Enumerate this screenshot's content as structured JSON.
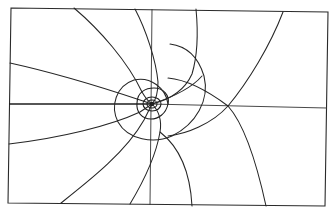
{
  "figure": {
    "kind": "field-line diagram",
    "stroke_color": "#262626",
    "background": "#ffffff",
    "frame": {
      "points": "11,8 328,12 325,206 8,203"
    },
    "axes": {
      "horizontal_left": "M 9,104 L 150,104",
      "horizontal_right": "M 150,104 L 327,108",
      "vertical": "M 152,9 L 150,205"
    },
    "center": {
      "cx": 152,
      "cy": 104
    },
    "rings": [
      {
        "name": "ring-inner",
        "d": "M 147,104 a 5,4 0 1,0 10,0 a 5,4 0 1,0 -10,0"
      },
      {
        "name": "ring-small",
        "d": "M 143,104 a 9,7 0 1,0 18,0 a 9,7 0 1,0 -18,0"
      },
      {
        "name": "ring-mid",
        "d": "M 137,103 C 137,92 146,88 154,88 C 163,88 170,95 168,104 C 166,114 158,119 151,119 C 142,119 136,112 137,103 Z"
      }
    ],
    "curves": [
      {
        "name": "spiral-large",
        "d": "M 168,104 C 166,88 150,76 134,80 C 116,86 110,106 118,122 C 128,140 154,144 172,136 C 196,124 210,100 204,76 C 198,56 186,46 170,44"
      },
      {
        "name": "line-top-left-1",
        "d": "M 74,8 C 100,30 128,62 142,92 C 146,99 149,102 152,104"
      },
      {
        "name": "line-top-left-2",
        "d": "M 135,9 C 146,30 156,60 158,82 C 158,92 156,100 152,104"
      },
      {
        "name": "line-left-upper",
        "d": "M 10,63 C 60,74 110,90 140,100 C 146,102 149,103 152,104"
      },
      {
        "name": "line-left-lower",
        "d": "M 9,144 C 60,138 110,126 140,112 C 146,108 149,106 152,104"
      },
      {
        "name": "line-bottom-left",
        "d": "M 61,203 C 90,180 126,152 144,120 C 148,112 150,108 152,104"
      },
      {
        "name": "line-bottom-mid",
        "d": "M 130,204 C 142,184 156,156 160,132 C 162,120 158,110 152,104"
      },
      {
        "name": "line-top-mid",
        "d": "M 196,9 C 198,30 198,54 192,74 C 184,92 168,100 152,104"
      },
      {
        "name": "line-top-right",
        "d": "M 283,12 C 270,46 248,82 228,106 C 212,124 186,134 168,136"
      },
      {
        "name": "line-right-arc",
        "d": "M 168,78 C 190,80 212,94 228,106 C 244,124 256,160 266,206"
      },
      {
        "name": "line-bottom-right",
        "d": "M 160,132 C 178,146 190,168 192,206"
      },
      {
        "name": "line-center-right",
        "d": "M 152,104 C 170,98 190,90 202,76"
      }
    ]
  }
}
